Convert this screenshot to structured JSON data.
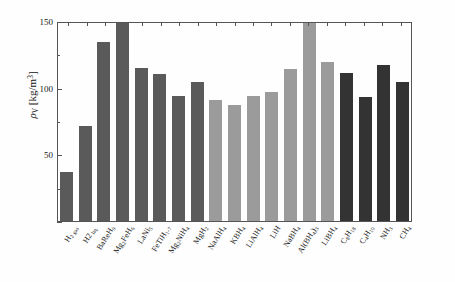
{
  "chart_data": {
    "type": "bar",
    "title": "",
    "xlabel": "",
    "ylabel": "ρ_V [kg/m3]",
    "ylabel_parts": {
      "symbol": "ρ",
      "subscript": "V",
      "units_open": " [kg/m",
      "units_exp": "3",
      "units_close": "]"
    },
    "ylim": [
      0,
      150
    ],
    "yticks": [
      0,
      50,
      100,
      150
    ],
    "ytick_labels": [
      "",
      "50",
      "100",
      "150"
    ],
    "grid": false,
    "legend": "none",
    "clipped_note": "Mg2FeH6 and Al(BH4)3 bars are clipped at the 150 axis maximum",
    "categories": [
      "H₂ gas",
      "H2 liq.",
      "BaReH₉",
      "Mg₂FeH₆",
      "LaNi₅",
      "FeTiH₁.₇",
      "Mg₂NiH₄",
      "MgH₂",
      "NaAlH₄",
      "KBH₄",
      "LiAlH₄",
      "LiH",
      "NaBH₄",
      "Al(BH₄)₃",
      "LiBH₄",
      "C₈H₁₈",
      "C₄H₁₀",
      "NH₃",
      "CH₄"
    ],
    "values": [
      37,
      71,
      134,
      150,
      115,
      110,
      94,
      104,
      91,
      87,
      94,
      97,
      114,
      150,
      119,
      111,
      93,
      117,
      104
    ],
    "bar_colors": [
      "#5a5a5a",
      "#5a5a5a",
      "#5a5a5a",
      "#5a5a5a",
      "#5a5a5a",
      "#5a5a5a",
      "#5a5a5a",
      "#5a5a5a",
      "#9b9b9b",
      "#9b9b9b",
      "#9b9b9b",
      "#9b9b9b",
      "#9b9b9b",
      "#9b9b9b",
      "#9b9b9b",
      "#333333",
      "#333333",
      "#333333",
      "#333333"
    ],
    "axis_color": "#555555",
    "background_color": "#ffffff"
  }
}
